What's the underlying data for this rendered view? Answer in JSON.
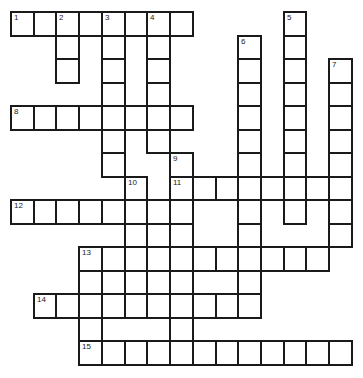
{
  "puzzle": {
    "type": "crossword",
    "rows": 15,
    "cols": 15,
    "origin": {
      "x": 11,
      "y": 12
    },
    "cell_size": {
      "w": 22.73,
      "h": 23.53
    },
    "line_color": "#1a1a1a",
    "fill_color": "#ffffff",
    "cells": [
      [
        0,
        0
      ],
      [
        0,
        1
      ],
      [
        0,
        2
      ],
      [
        0,
        3
      ],
      [
        0,
        4
      ],
      [
        0,
        5
      ],
      [
        0,
        6
      ],
      [
        0,
        7
      ],
      [
        0,
        12
      ],
      [
        1,
        2
      ],
      [
        1,
        4
      ],
      [
        1,
        6
      ],
      [
        1,
        10
      ],
      [
        1,
        12
      ],
      [
        2,
        2
      ],
      [
        2,
        4
      ],
      [
        2,
        6
      ],
      [
        2,
        10
      ],
      [
        2,
        12
      ],
      [
        2,
        14
      ],
      [
        3,
        4
      ],
      [
        3,
        6
      ],
      [
        3,
        10
      ],
      [
        3,
        12
      ],
      [
        3,
        14
      ],
      [
        4,
        0
      ],
      [
        4,
        1
      ],
      [
        4,
        2
      ],
      [
        4,
        3
      ],
      [
        4,
        4
      ],
      [
        4,
        5
      ],
      [
        4,
        6
      ],
      [
        4,
        7
      ],
      [
        4,
        10
      ],
      [
        4,
        12
      ],
      [
        4,
        14
      ],
      [
        5,
        4
      ],
      [
        5,
        6
      ],
      [
        5,
        10
      ],
      [
        5,
        12
      ],
      [
        5,
        14
      ],
      [
        6,
        4
      ],
      [
        6,
        7
      ],
      [
        6,
        10
      ],
      [
        6,
        12
      ],
      [
        6,
        14
      ],
      [
        7,
        5
      ],
      [
        7,
        7
      ],
      [
        7,
        8
      ],
      [
        7,
        9
      ],
      [
        7,
        10
      ],
      [
        7,
        11
      ],
      [
        7,
        12
      ],
      [
        7,
        13
      ],
      [
        7,
        14
      ],
      [
        8,
        0
      ],
      [
        8,
        1
      ],
      [
        8,
        2
      ],
      [
        8,
        3
      ],
      [
        8,
        4
      ],
      [
        8,
        5
      ],
      [
        8,
        6
      ],
      [
        8,
        7
      ],
      [
        8,
        10
      ],
      [
        8,
        12
      ],
      [
        8,
        14
      ],
      [
        9,
        5
      ],
      [
        9,
        6
      ],
      [
        9,
        7
      ],
      [
        9,
        10
      ],
      [
        9,
        14
      ],
      [
        10,
        3
      ],
      [
        10,
        4
      ],
      [
        10,
        5
      ],
      [
        10,
        6
      ],
      [
        10,
        7
      ],
      [
        10,
        8
      ],
      [
        10,
        9
      ],
      [
        10,
        10
      ],
      [
        10,
        11
      ],
      [
        10,
        12
      ],
      [
        10,
        13
      ],
      [
        11,
        3
      ],
      [
        11,
        4
      ],
      [
        11,
        5
      ],
      [
        11,
        6
      ],
      [
        11,
        7
      ],
      [
        11,
        10
      ],
      [
        12,
        1
      ],
      [
        12,
        2
      ],
      [
        12,
        3
      ],
      [
        12,
        4
      ],
      [
        12,
        5
      ],
      [
        12,
        6
      ],
      [
        12,
        7
      ],
      [
        12,
        8
      ],
      [
        12,
        9
      ],
      [
        12,
        10
      ],
      [
        13,
        3
      ],
      [
        13,
        7
      ],
      [
        14,
        3
      ],
      [
        14,
        4
      ],
      [
        14,
        5
      ],
      [
        14,
        6
      ],
      [
        14,
        7
      ],
      [
        14,
        8
      ],
      [
        14,
        9
      ],
      [
        14,
        10
      ],
      [
        14,
        11
      ],
      [
        14,
        12
      ],
      [
        14,
        13
      ],
      [
        14,
        14
      ]
    ],
    "numbers": [
      {
        "label": "1",
        "row": 0,
        "col": 0
      },
      {
        "label": "2",
        "row": 0,
        "col": 2
      },
      {
        "label": "3",
        "row": 0,
        "col": 4
      },
      {
        "label": "4",
        "row": 0,
        "col": 6
      },
      {
        "label": "5",
        "row": 0,
        "col": 12
      },
      {
        "label": "6",
        "row": 1,
        "col": 10
      },
      {
        "label": "7",
        "row": 2,
        "col": 14
      },
      {
        "label": "8",
        "row": 4,
        "col": 0
      },
      {
        "label": "9",
        "row": 6,
        "col": 7
      },
      {
        "label": "10",
        "row": 7,
        "col": 5
      },
      {
        "label": "11",
        "row": 7,
        "col": 7
      },
      {
        "label": "12",
        "row": 8,
        "col": 0
      },
      {
        "label": "13",
        "row": 10,
        "col": 3
      },
      {
        "label": "14",
        "row": 12,
        "col": 1
      },
      {
        "label": "15",
        "row": 14,
        "col": 3
      }
    ]
  }
}
